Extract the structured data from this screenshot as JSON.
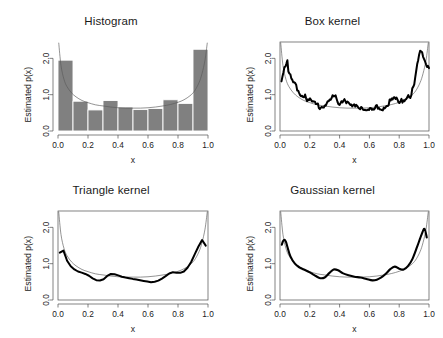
{
  "figure": {
    "layout": "2x2",
    "background": "#ffffff",
    "bar_color": "#808080",
    "line_color": "#000000",
    "true_curve_color": "#5a5a5a"
  },
  "chart_data": [
    {
      "type": "bar",
      "title": "Histogram",
      "xlabel": "x",
      "ylabel": "Estimated p(x)",
      "xlim": [
        0.0,
        1.0
      ],
      "ylim": [
        0.0,
        2.45
      ],
      "xticks": [
        "0.0",
        "0.2",
        "0.4",
        "0.6",
        "0.8",
        "1.0"
      ],
      "xtick_values": [
        0.0,
        0.2,
        0.4,
        0.6,
        0.8,
        1.0
      ],
      "yticks": [
        "0.0",
        "1.0",
        "2.0"
      ],
      "ytick_values": [
        0.0,
        1.0,
        2.0
      ],
      "grid": false,
      "frame": "L-axes",
      "bin_edges": [
        0.0,
        0.1,
        0.2,
        0.3,
        0.4,
        0.5,
        0.6,
        0.7,
        0.8,
        0.9,
        1.0
      ],
      "categories": [
        "0.0-0.1",
        "0.1-0.2",
        "0.2-0.3",
        "0.3-0.4",
        "0.4-0.5",
        "0.5-0.6",
        "0.6-0.7",
        "0.7-0.8",
        "0.8-0.9",
        "0.9-1.0"
      ],
      "values": [
        1.95,
        0.82,
        0.58,
        0.84,
        0.66,
        0.59,
        0.62,
        0.86,
        0.76,
        2.25
      ],
      "overlay_curve": {
        "name": "true density",
        "x": [
          0.005,
          0.02,
          0.04,
          0.06,
          0.09,
          0.12,
          0.16,
          0.2,
          0.25,
          0.3,
          0.35,
          0.4,
          0.45,
          0.5,
          0.55,
          0.6,
          0.65,
          0.7,
          0.75,
          0.8,
          0.84,
          0.88,
          0.91,
          0.94,
          0.96,
          0.98,
          0.995
        ],
        "y": [
          2.42,
          1.8,
          1.42,
          1.22,
          1.05,
          0.94,
          0.84,
          0.78,
          0.72,
          0.69,
          0.66,
          0.64,
          0.63,
          0.63,
          0.63,
          0.64,
          0.66,
          0.69,
          0.73,
          0.79,
          0.86,
          0.97,
          1.1,
          1.33,
          1.58,
          1.95,
          2.42
        ]
      }
    },
    {
      "type": "line",
      "title": "Box kernel",
      "xlabel": "x",
      "ylabel": "Estimated p(x)",
      "xlim": [
        0.0,
        1.0
      ],
      "ylim": [
        0.0,
        2.45
      ],
      "xticks": [
        "0.0",
        "0.2",
        "0.4",
        "0.6",
        "0.8",
        "1.0"
      ],
      "xtick_values": [
        0.0,
        0.2,
        0.4,
        0.6,
        0.8,
        1.0
      ],
      "yticks": [
        "0.0",
        "1.0",
        "2.0"
      ],
      "ytick_values": [
        0.0,
        1.0,
        2.0
      ],
      "grid": false,
      "frame": "box",
      "smoothness": "very-jagged",
      "noise_amplitude": 0.1,
      "noise_frequency": 150,
      "series": [
        {
          "name": "box kernel estimate",
          "style": "thick",
          "x": [
            0.01,
            0.02,
            0.03,
            0.04,
            0.05,
            0.055,
            0.06,
            0.08,
            0.1,
            0.13,
            0.16,
            0.19,
            0.22,
            0.25,
            0.28,
            0.31,
            0.34,
            0.36,
            0.38,
            0.41,
            0.44,
            0.47,
            0.5,
            0.53,
            0.56,
            0.59,
            0.62,
            0.65,
            0.68,
            0.71,
            0.74,
            0.77,
            0.79,
            0.82,
            0.85,
            0.88,
            0.91,
            0.93,
            0.95,
            0.96,
            0.98,
            1.0
          ],
          "y": [
            1.38,
            1.55,
            1.72,
            1.86,
            1.92,
            1.62,
            1.58,
            1.4,
            1.25,
            1.06,
            0.95,
            0.88,
            0.8,
            0.68,
            0.62,
            0.72,
            0.88,
            0.93,
            0.86,
            0.78,
            0.8,
            0.74,
            0.7,
            0.64,
            0.6,
            0.58,
            0.56,
            0.62,
            0.6,
            0.7,
            0.86,
            0.92,
            0.82,
            0.8,
            0.88,
            1.0,
            1.45,
            2.08,
            2.28,
            2.1,
            1.88,
            1.78
          ]
        },
        {
          "name": "true density",
          "style": "thin",
          "x": [
            0.005,
            0.02,
            0.04,
            0.06,
            0.09,
            0.12,
            0.16,
            0.2,
            0.25,
            0.3,
            0.35,
            0.4,
            0.45,
            0.5,
            0.55,
            0.6,
            0.65,
            0.7,
            0.75,
            0.8,
            0.84,
            0.88,
            0.91,
            0.94,
            0.96,
            0.98,
            0.995
          ],
          "y": [
            2.42,
            1.8,
            1.42,
            1.22,
            1.05,
            0.94,
            0.84,
            0.78,
            0.72,
            0.69,
            0.66,
            0.64,
            0.63,
            0.63,
            0.63,
            0.64,
            0.66,
            0.69,
            0.73,
            0.79,
            0.86,
            0.97,
            1.1,
            1.33,
            1.58,
            1.95,
            2.42
          ]
        }
      ]
    },
    {
      "type": "line",
      "title": "Triangle kernel",
      "xlabel": "x",
      "ylabel": "Estimated p(x)",
      "xlim": [
        0.0,
        1.0
      ],
      "ylim": [
        0.0,
        2.45
      ],
      "xticks": [
        "0.0",
        "0.2",
        "0.4",
        "0.6",
        "0.8",
        "1.0"
      ],
      "xtick_values": [
        0.0,
        0.2,
        0.4,
        0.6,
        0.8,
        1.0
      ],
      "yticks": [
        "0.0",
        "1.0",
        "2.0"
      ],
      "ytick_values": [
        0.0,
        1.0,
        2.0
      ],
      "grid": false,
      "frame": "box",
      "smoothness": "smooth",
      "noise_amplitude": 0.012,
      "noise_frequency": 40,
      "series": [
        {
          "name": "triangle kernel estimate",
          "style": "thick",
          "x": [
            0.012,
            0.02,
            0.03,
            0.04,
            0.05,
            0.07,
            0.1,
            0.13,
            0.16,
            0.2,
            0.24,
            0.27,
            0.3,
            0.33,
            0.36,
            0.39,
            0.42,
            0.46,
            0.5,
            0.54,
            0.58,
            0.62,
            0.65,
            0.68,
            0.71,
            0.74,
            0.77,
            0.8,
            0.83,
            0.86,
            0.89,
            0.92,
            0.95,
            0.97,
            0.985
          ],
          "y": [
            1.3,
            1.38,
            1.4,
            1.34,
            1.2,
            0.98,
            0.86,
            0.8,
            0.75,
            0.68,
            0.58,
            0.52,
            0.55,
            0.66,
            0.72,
            0.7,
            0.64,
            0.6,
            0.58,
            0.56,
            0.52,
            0.48,
            0.5,
            0.56,
            0.64,
            0.73,
            0.78,
            0.74,
            0.76,
            0.88,
            1.06,
            1.32,
            1.58,
            1.7,
            1.5
          ]
        },
        {
          "name": "true density",
          "style": "thin",
          "x": [
            0.005,
            0.02,
            0.04,
            0.06,
            0.09,
            0.12,
            0.16,
            0.2,
            0.25,
            0.3,
            0.35,
            0.4,
            0.45,
            0.5,
            0.55,
            0.6,
            0.65,
            0.7,
            0.75,
            0.8,
            0.84,
            0.88,
            0.91,
            0.94,
            0.96,
            0.98,
            0.995
          ],
          "y": [
            2.42,
            1.8,
            1.42,
            1.22,
            1.05,
            0.94,
            0.84,
            0.78,
            0.72,
            0.69,
            0.66,
            0.64,
            0.63,
            0.63,
            0.63,
            0.64,
            0.66,
            0.69,
            0.73,
            0.79,
            0.86,
            0.97,
            1.1,
            1.33,
            1.58,
            1.95,
            2.42
          ]
        }
      ]
    },
    {
      "type": "line",
      "title": "Gaussian kernel",
      "xlabel": "x",
      "ylabel": "Estimated p(x)",
      "xlim": [
        0.0,
        1.0
      ],
      "ylim": [
        0.0,
        2.45
      ],
      "xticks": [
        "0.0",
        "0.2",
        "0.4",
        "0.6",
        "0.8",
        "1.0"
      ],
      "xtick_values": [
        0.0,
        0.2,
        0.4,
        0.6,
        0.8,
        1.0
      ],
      "yticks": [
        "0.0",
        "1.0",
        "2.0"
      ],
      "ytick_values": [
        0.0,
        1.0,
        2.0
      ],
      "grid": false,
      "frame": "box",
      "smoothness": "very-smooth",
      "noise_amplitude": 0.0,
      "noise_frequency": 0,
      "series": [
        {
          "name": "gaussian kernel estimate",
          "style": "thick",
          "x": [
            0.012,
            0.02,
            0.03,
            0.04,
            0.05,
            0.07,
            0.1,
            0.13,
            0.16,
            0.2,
            0.24,
            0.27,
            0.3,
            0.33,
            0.36,
            0.39,
            0.42,
            0.46,
            0.5,
            0.54,
            0.58,
            0.62,
            0.65,
            0.68,
            0.71,
            0.74,
            0.77,
            0.8,
            0.83,
            0.86,
            0.89,
            0.92,
            0.95,
            0.97,
            0.985
          ],
          "y": [
            1.52,
            1.62,
            1.66,
            1.6,
            1.46,
            1.2,
            1.0,
            0.9,
            0.84,
            0.76,
            0.66,
            0.6,
            0.62,
            0.74,
            0.84,
            0.82,
            0.74,
            0.68,
            0.64,
            0.62,
            0.58,
            0.54,
            0.56,
            0.62,
            0.72,
            0.85,
            0.92,
            0.86,
            0.84,
            0.94,
            1.14,
            1.46,
            1.8,
            1.96,
            1.72
          ]
        },
        {
          "name": "true density",
          "style": "thin",
          "x": [
            0.005,
            0.02,
            0.04,
            0.06,
            0.09,
            0.12,
            0.16,
            0.2,
            0.25,
            0.3,
            0.35,
            0.4,
            0.45,
            0.5,
            0.55,
            0.6,
            0.65,
            0.7,
            0.75,
            0.8,
            0.84,
            0.88,
            0.91,
            0.94,
            0.96,
            0.98,
            0.995
          ],
          "y": [
            2.42,
            1.8,
            1.42,
            1.22,
            1.05,
            0.94,
            0.84,
            0.78,
            0.72,
            0.69,
            0.66,
            0.64,
            0.63,
            0.63,
            0.63,
            0.64,
            0.66,
            0.69,
            0.73,
            0.79,
            0.86,
            0.97,
            1.1,
            1.33,
            1.58,
            1.95,
            2.42
          ]
        }
      ]
    }
  ]
}
